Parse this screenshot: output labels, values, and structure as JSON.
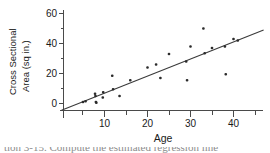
{
  "figure": {
    "name": "age-vs-cross-sectional-area-scatter"
  },
  "axis": {
    "x_title": "Age",
    "y_title_line1": "Cross Sectional",
    "y_title_line2": "Area (sq in.)",
    "x_ticks": [
      "10",
      "20",
      "30",
      "40"
    ],
    "y_ticks": [
      "0",
      "20",
      "40",
      "60"
    ]
  },
  "caption": {
    "text": "tion 3-15. Compute the estimated regression line"
  },
  "colors": {
    "axis": "#4a4a4a",
    "point": "#2b2b2b",
    "line": "#3a3a3a",
    "text": "#1a1a1a",
    "background": "#ffffff"
  },
  "chart_data": {
    "type": "scatter",
    "title": "",
    "xlabel": "Age",
    "ylabel": "Cross Sectional Area (sq in.)",
    "xlim": [
      0,
      47
    ],
    "ylim": [
      -6,
      64
    ],
    "x_tick_values": [
      10,
      20,
      30,
      40
    ],
    "y_tick_values": [
      0,
      20,
      40,
      60
    ],
    "x_minor_tick_values": [
      5,
      15,
      25,
      35,
      45
    ],
    "grid": false,
    "legend": null,
    "points": [
      {
        "x": 5.0,
        "y": 1.0
      },
      {
        "x": 5.6,
        "y": 1.5
      },
      {
        "x": 7.8,
        "y": 6.5
      },
      {
        "x": 7.9,
        "y": 5.0
      },
      {
        "x": 8.0,
        "y": 1.0
      },
      {
        "x": 8.1,
        "y": 0.5
      },
      {
        "x": 9.6,
        "y": 4.0
      },
      {
        "x": 9.7,
        "y": 7.5
      },
      {
        "x": 11.8,
        "y": 18.5
      },
      {
        "x": 12.0,
        "y": 9.5
      },
      {
        "x": 13.5,
        "y": 5.0
      },
      {
        "x": 16.0,
        "y": 15.5
      },
      {
        "x": 20.0,
        "y": 24.0
      },
      {
        "x": 22.0,
        "y": 26.0
      },
      {
        "x": 23.0,
        "y": 17.0
      },
      {
        "x": 25.0,
        "y": 33.0
      },
      {
        "x": 29.0,
        "y": 28.0
      },
      {
        "x": 29.2,
        "y": 15.5
      },
      {
        "x": 30.0,
        "y": 38.0
      },
      {
        "x": 33.0,
        "y": 50.0
      },
      {
        "x": 33.3,
        "y": 33.5
      },
      {
        "x": 35.0,
        "y": 37.0
      },
      {
        "x": 38.0,
        "y": 38.0
      },
      {
        "x": 38.2,
        "y": 19.5
      },
      {
        "x": 40.0,
        "y": 43.0
      },
      {
        "x": 41.0,
        "y": 42.0
      }
    ],
    "fit_line": {
      "label": "least-squares regression line",
      "x_start": 0.0,
      "y_start": -4.5,
      "x_end": 47.0,
      "y_end": 49.0
    }
  }
}
